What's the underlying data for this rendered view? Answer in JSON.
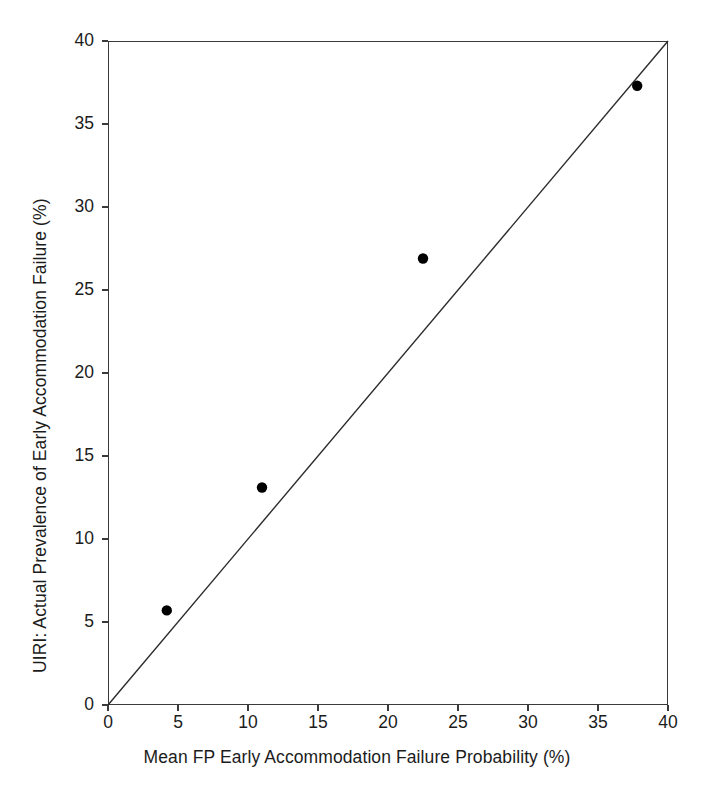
{
  "chart_data": {
    "type": "scatter",
    "title": "",
    "xlabel": "Mean FP Early Accommodation Failure Probability (%)",
    "ylabel": "UIRI: Actual Prevalence of Early Accommodation Failure (%)",
    "xlim": [
      0,
      40
    ],
    "ylim": [
      0,
      40
    ],
    "xticks": [
      0,
      5,
      10,
      15,
      20,
      25,
      30,
      35,
      40
    ],
    "yticks": [
      0,
      5,
      10,
      15,
      20,
      25,
      30,
      35,
      40
    ],
    "xticklabels": [
      "0",
      "5",
      "10",
      "15",
      "20",
      "25",
      "30",
      "35",
      "40"
    ],
    "yticklabels": [
      "0",
      "5",
      "10",
      "15",
      "20",
      "25",
      "30",
      "35",
      "40"
    ],
    "grid": false,
    "legend": null,
    "series": [
      {
        "name": "Observed groups",
        "marker": "filled-circle",
        "color": "#000000",
        "points": [
          {
            "x": 4.2,
            "y": 5.7
          },
          {
            "x": 11.0,
            "y": 13.1
          },
          {
            "x": 22.5,
            "y": 26.9
          },
          {
            "x": 37.8,
            "y": 37.3
          }
        ]
      }
    ],
    "reference_line": {
      "name": "identity-line",
      "from": {
        "x": 0,
        "y": 0
      },
      "to": {
        "x": 40,
        "y": 40
      },
      "color": "#2b2b2b"
    },
    "frame_color": "#3a3a3a",
    "background": "#ffffff"
  }
}
